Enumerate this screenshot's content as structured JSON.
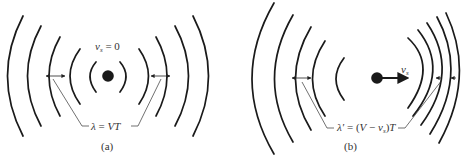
{
  "panel_a": {
    "caption": "(a)",
    "source_label": {
      "symbol": "v",
      "subscript": "s",
      "rest": " = 0"
    },
    "wavelength_label": {
      "lhs": "λ",
      "eq": " = ",
      "rhs": "VT"
    },
    "source_color": "#1a1a1a"
  },
  "panel_b": {
    "caption": "(b)",
    "velocity_label": {
      "symbol": "v",
      "subscript": "s"
    },
    "wavelength_label": {
      "lhs": "λ′",
      "eq": " = (",
      "V": "V",
      "minus": " − ",
      "v": "v",
      "subscript": "s",
      "close": ")",
      "T": "T"
    },
    "source_color": "#1a1a1a"
  }
}
